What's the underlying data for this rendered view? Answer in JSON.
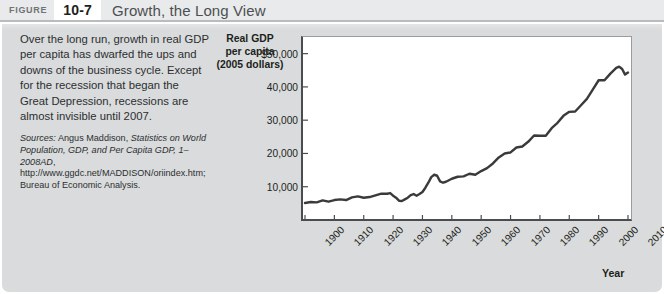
{
  "header": {
    "figure_word": "FIGURE",
    "figure_number": "10-7",
    "title": "Growth, the Long View"
  },
  "caption": {
    "body": "Over the long run, growth in real GDP per capita has dwarfed the ups and downs of the business cycle. Except for the recession that began the Great Depression, recessions are almost invisible until 2007.",
    "sources_label": "Sources:",
    "sources_author": "Angus Maddison,",
    "sources_work": "Statistics on World Population, GDP, and Per Capita GDP, 1–2008AD",
    "sources_url": "http://www.ggdc.net/MADDISON/oriindex.htm;",
    "sources_extra": "Bureau of Economic Analysis."
  },
  "chart_data": {
    "type": "line",
    "title": "Growth, the Long View",
    "ylabel": "Real GDP per capita (2005 dollars)",
    "xlabel": "Year",
    "ylim": [
      0,
      55000
    ],
    "xlim": [
      1900,
      2010
    ],
    "grid": false,
    "legend": "none",
    "line_color": "#3a3a3a",
    "ytick_labels": [
      "$50,000",
      "40,000",
      "30,000",
      "20,000",
      "10,000"
    ],
    "ytick_values": [
      50000,
      40000,
      30000,
      20000,
      10000
    ],
    "xtick_labels": [
      "1900",
      "1910",
      "1920",
      "1930",
      "1940",
      "1950",
      "1960",
      "1970",
      "1980",
      "1990",
      "2000",
      "2010"
    ],
    "xtick_values": [
      1900,
      1910,
      1920,
      1930,
      1940,
      1950,
      1960,
      1970,
      1980,
      1990,
      2000,
      2010
    ],
    "series": [
      {
        "name": "Real GDP per capita",
        "x": [
          1900,
          1902,
          1904,
          1906,
          1908,
          1910,
          1912,
          1914,
          1916,
          1918,
          1920,
          1922,
          1924,
          1926,
          1928,
          1929,
          1930,
          1931,
          1932,
          1933,
          1934,
          1935,
          1936,
          1937,
          1938,
          1939,
          1940,
          1941,
          1942,
          1943,
          1944,
          1945,
          1946,
          1947,
          1948,
          1950,
          1952,
          1954,
          1956,
          1958,
          1960,
          1962,
          1964,
          1966,
          1968,
          1970,
          1972,
          1974,
          1976,
          1978,
          1980,
          1982,
          1984,
          1986,
          1988,
          1990,
          1992,
          1994,
          1996,
          1998,
          2000,
          2002,
          2004,
          2006,
          2007,
          2008,
          2009,
          2010
        ],
        "values": [
          5100,
          5400,
          5300,
          5900,
          5500,
          6000,
          6200,
          6000,
          6800,
          7100,
          6700,
          6900,
          7400,
          7900,
          7900,
          8100,
          7300,
          6700,
          5800,
          5700,
          6200,
          6700,
          7500,
          7800,
          7300,
          7800,
          8400,
          9700,
          11200,
          12900,
          13600,
          13300,
          11600,
          11200,
          11500,
          12400,
          13000,
          13100,
          13900,
          13600,
          14700,
          15600,
          17000,
          18800,
          20000,
          20300,
          21800,
          22100,
          23500,
          25400,
          25300,
          25300,
          27600,
          29200,
          31300,
          32500,
          32600,
          34500,
          36400,
          39200,
          42000,
          42000,
          44000,
          45700,
          46100,
          45400,
          43700,
          44300
        ]
      }
    ],
    "annotations": [
      {
        "label": "Great Depression trough",
        "year": 1933,
        "value": 5700
      },
      {
        "label": "World War II peak",
        "year": 1944,
        "value": 13600
      },
      {
        "label": "2007 peak before recession",
        "year": 2007,
        "value": 46100
      }
    ]
  }
}
